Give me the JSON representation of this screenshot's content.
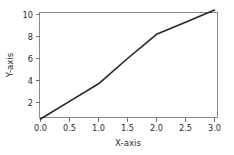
{
  "chart_data": {
    "type": "line",
    "title": "",
    "xlabel": "X-axis",
    "ylabel": "Y-axis",
    "xlim": [
      -0.12,
      3.12
    ],
    "ylim": [
      -0.05,
      11.0
    ],
    "xticks": [
      0.0,
      0.5,
      1.0,
      1.5,
      2.0,
      2.5,
      3.0
    ],
    "xticklabels": [
      "0.0",
      "0.5",
      "1.0",
      "1.5",
      "2.0",
      "2.5",
      "3.0"
    ],
    "yticks": [
      2,
      4,
      6,
      8,
      10
    ],
    "yticklabels": [
      "2",
      "4",
      "6",
      "8",
      "10"
    ],
    "grid": false,
    "legend": false,
    "series": [
      {
        "name": "series-1",
        "color": "#262626",
        "x": [
          0.0,
          0.5,
          1.0,
          1.5,
          2.0,
          2.5,
          3.0
        ],
        "values": [
          0.5,
          2.1,
          3.7,
          6.0,
          8.2,
          9.3,
          10.4
        ]
      }
    ]
  },
  "figure": {
    "background_color": "#ffffff",
    "frame_color": "#8a8a8a",
    "tick_color": "#6e6e6e",
    "text_color": "#2b2b2b"
  }
}
